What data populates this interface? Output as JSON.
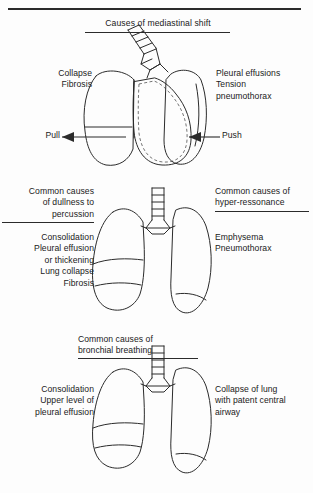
{
  "figure": {
    "kind": "medical-illustration"
  },
  "panel1": {
    "title": "Causes of mediastinal shift",
    "left_text": "Collapse\nFibrosis",
    "right_text": "Pleural effusions\nTension\npneumothorax",
    "left_arrow_label": "Pull",
    "right_arrow_label": "Push",
    "diagram_name": "mediastinal-shift-lungs"
  },
  "panel2": {
    "left_title": "Common causes\nof dullness to\npercussion",
    "right_title": "Common causes of\nhyper-ressonance",
    "left_items": "Consolidation\nPleural effusion\nor thickening\nLung collapse\nFibrosis",
    "right_items": "Emphysema\nPneumothorax",
    "diagram_name": "dullness-vs-hyperresonance-lungs"
  },
  "panel3": {
    "title": "Common causes of\nbronchial breathing",
    "left_text": "Consolidation\nUpper level of\npleural effusion",
    "right_text": "Collapse of lung\nwith patent central\nairway",
    "diagram_name": "bronchial-breathing-lungs"
  },
  "colors": {
    "ink": "#2b2b2b",
    "dull_lung_fill": "#b9b9b9",
    "light_lung_fill": "#e8e8e8",
    "stipple": "#6f6f6f",
    "hatch": "#555555",
    "page": "#fdfdfd"
  }
}
